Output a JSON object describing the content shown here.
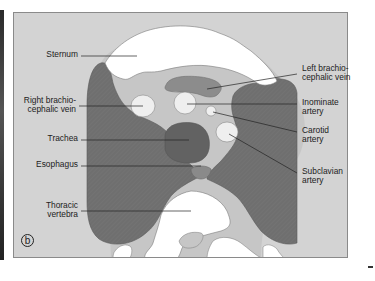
{
  "figure": {
    "panel_letter": "b",
    "colors": {
      "background": "#d3d3d3",
      "lung": "#6f6f6f",
      "mediastinum": "#c4c4c4",
      "bone": "#ffffff",
      "vessel_light": "#efefef",
      "trachea": "#626262",
      "vein_band": "#8c8c8c",
      "leader_line": "#222222"
    },
    "labels_left": [
      {
        "id": "sternum",
        "text": "Sternum"
      },
      {
        "id": "right-brachiocephalic-vein",
        "text": "Right brachio-\ncephalic vein"
      },
      {
        "id": "trachea",
        "text": "Trachea"
      },
      {
        "id": "esophagus",
        "text": "Esophagus"
      },
      {
        "id": "thoracic-vertebra",
        "text": "Thoracic\nvertebra"
      }
    ],
    "labels_right": [
      {
        "id": "left-brachiocephalic-vein",
        "text": "Left brachio-\ncephalic vein"
      },
      {
        "id": "inominate-artery",
        "text": "Inominate\nartery"
      },
      {
        "id": "carotid-artery",
        "text": "Carotid\nartery"
      },
      {
        "id": "subclavian-artery",
        "text": "Subclavian\nartery"
      }
    ]
  }
}
